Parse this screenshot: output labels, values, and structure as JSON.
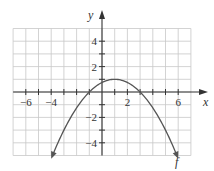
{
  "chart_data": {
    "type": "line",
    "title": "",
    "xlabel": "x",
    "ylabel": "y",
    "xlim": [
      -7,
      7
    ],
    "ylim": [
      -5,
      5
    ],
    "grid": true,
    "x_ticks": [
      -6,
      -4,
      2,
      6
    ],
    "x_tick_labels": [
      "−6",
      "−4",
      "2",
      "6"
    ],
    "y_ticks": [
      4,
      2,
      -2,
      -4
    ],
    "y_tick_labels": [
      "4",
      "2",
      "−2",
      "−4"
    ],
    "series": [
      {
        "name": "f",
        "formula": "f(x) = -(1/4)(x-1)^2 + 1",
        "x": [
          -4,
          -3,
          -2,
          -1,
          0,
          1,
          2,
          3,
          4,
          5,
          6
        ],
        "y": [
          -5.25,
          -3,
          -1.25,
          0,
          0.75,
          1,
          0.75,
          0,
          -1.25,
          -3,
          -5.25
        ],
        "vertex": [
          1,
          1
        ],
        "zeros": [
          -1,
          3
        ],
        "arrows_at_ends": true
      }
    ],
    "annotations": [
      {
        "text": "f",
        "x": 6,
        "y": -6
      }
    ]
  },
  "colors": {
    "grid": "#c8c8c8",
    "axis": "#333333",
    "curve": "#555555"
  }
}
